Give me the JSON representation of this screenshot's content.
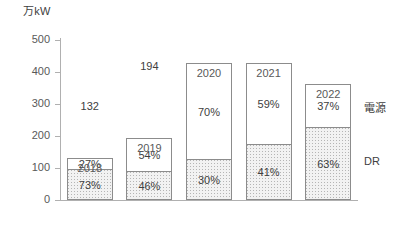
{
  "chart_data": {
    "type": "bar",
    "stacked": true,
    "title": "",
    "xlabel": "",
    "ylabel": "万kW",
    "unit_label": "万kW",
    "ylim": [
      0,
      500
    ],
    "yticks": [
      0,
      100,
      200,
      300,
      400,
      500
    ],
    "ytick_labels": [
      "0",
      "100",
      "200",
      "300",
      "400",
      "500"
    ],
    "grid": false,
    "legend_position": "right-inline",
    "categories": [
      "2018",
      "2019",
      "2020",
      "2021",
      "2022"
    ],
    "totals": [
      132,
      194,
      427,
      427,
      364
    ],
    "total_labels": [
      "132",
      "194",
      "427",
      "427",
      "364"
    ],
    "series": [
      {
        "name": "電源",
        "stack_position": "upper",
        "fill": "white",
        "values_pct": [
          27,
          54,
          70,
          59,
          37
        ],
        "labels": [
          "27%",
          "54%",
          "70%",
          "59%",
          "37%"
        ]
      },
      {
        "name": "DR",
        "stack_position": "lower",
        "fill": "dotted-gray",
        "values_pct": [
          73,
          46,
          30,
          41,
          63
        ],
        "labels": [
          "73%",
          "46%",
          "30%",
          "41%",
          "63%"
        ]
      }
    ],
    "legend": [
      {
        "label": "電源",
        "swatch": "white"
      },
      {
        "label": "DR",
        "swatch": "dotted-gray"
      }
    ]
  },
  "colors": {
    "axis": "#b0b0b0",
    "bar_outline": "#8c8c8c",
    "dr_fill": "#f2f2f2",
    "dr_dot": "#b5b5b5",
    "genset_fill": "#ffffff",
    "text": "#404040",
    "tick_text": "#595959"
  }
}
